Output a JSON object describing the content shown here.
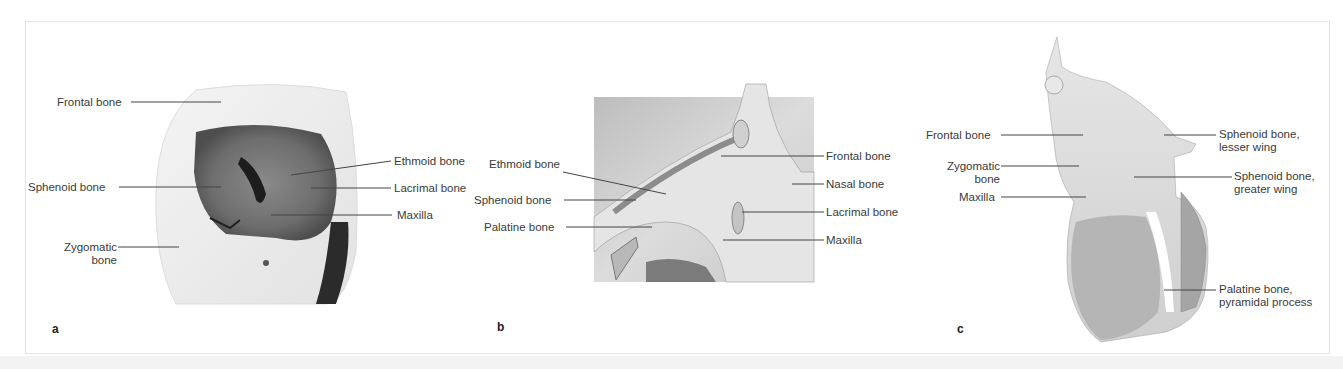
{
  "figure": {
    "panels": [
      {
        "letter": "a",
        "labels": {
          "frontal": "Frontal bone",
          "sphenoid": "Sphenoid bone",
          "zygomatic_1": "Zygomatic",
          "zygomatic_2": "bone",
          "ethmoid": "Ethmoid bone",
          "lacrimal": "Lacrimal bone",
          "maxilla": "Maxilla"
        }
      },
      {
        "letter": "b",
        "labels": {
          "ethmoid": "Ethmoid bone",
          "sphenoid": "Sphenoid bone",
          "palatine": "Palatine bone",
          "frontal": "Frontal bone",
          "nasal": "Nasal bone",
          "lacrimal": "Lacrimal bone",
          "maxilla": "Maxilla"
        }
      },
      {
        "letter": "c",
        "labels": {
          "frontal": "Frontal bone",
          "zygomatic_1": "Zygomatic",
          "zygomatic_2": "bone",
          "maxilla": "Maxilla",
          "sphenoid_lesser_1": "Sphenoid bone,",
          "sphenoid_lesser_2": "lesser wing",
          "sphenoid_greater_1": "Sphenoid bone,",
          "sphenoid_greater_2": "greater wing",
          "palatine_1": "Palatine bone,",
          "palatine_2": "pyramidal process"
        }
      }
    ]
  }
}
